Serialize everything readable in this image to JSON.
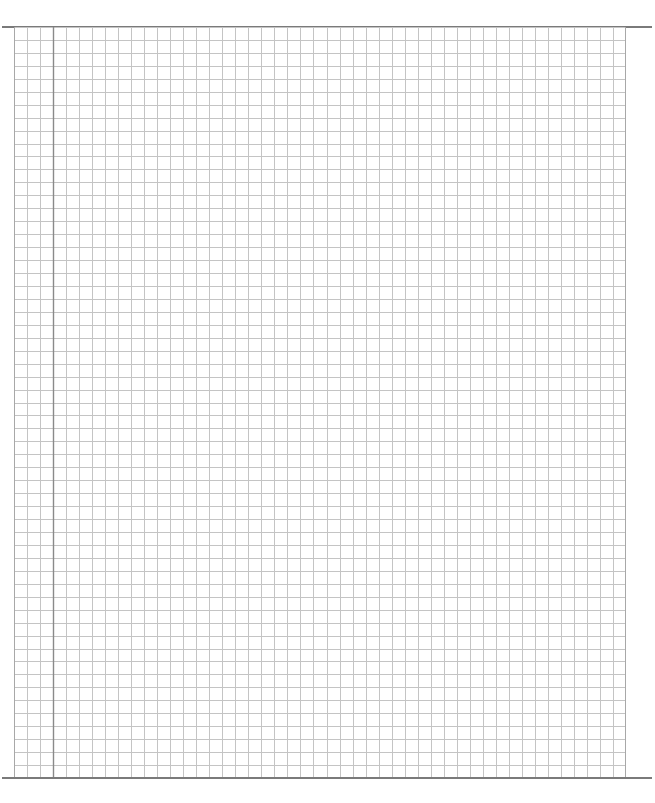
{
  "document": {
    "type": "graph-paper",
    "content": "",
    "grid": {
      "columns": 47,
      "rows": 58,
      "margin_column_index": 3
    },
    "colors": {
      "background": "#ffffff",
      "grid_line": "#c4c4c4",
      "margin_line": "#8a8a8a",
      "rule_line": "#7a7a7a"
    }
  }
}
